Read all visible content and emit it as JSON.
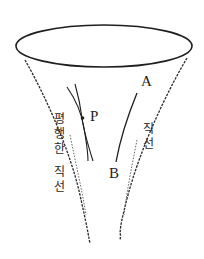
{
  "figure": {
    "colors": {
      "line": "#1e1e1e",
      "background": "#ffffff"
    },
    "labels": {
      "point_a": "A",
      "point_b": "B",
      "point_p": "P",
      "left_caption": "평행한 직선",
      "left_caption_chars": [
        "평",
        "행",
        "한",
        " ",
        "직",
        "선"
      ],
      "right_caption": "직선",
      "right_caption_chars": [
        "직",
        "선"
      ]
    }
  }
}
